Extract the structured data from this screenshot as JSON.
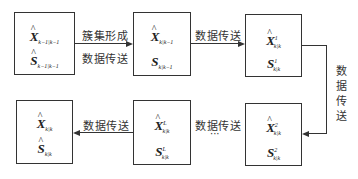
{
  "diagram": {
    "nodes": [
      {
        "id": "box1",
        "x_base": "X",
        "x_hat": true,
        "x_sup": "",
        "x_sub": "k−1|k−1",
        "s_base": "S",
        "s_hat": true,
        "s_sup": "",
        "s_sub": "k−1|k−1"
      },
      {
        "id": "box2",
        "x_base": "X",
        "x_hat": true,
        "x_sup": "",
        "x_sub": "k|k−1",
        "s_base": "S",
        "s_hat": false,
        "s_sup": "",
        "s_sub": "k|k−1"
      },
      {
        "id": "box3",
        "x_base": "X",
        "x_hat": true,
        "x_sup": "1",
        "x_sub": "k|k",
        "s_base": "S",
        "s_hat": false,
        "s_sup": "1",
        "s_sub": "k|k"
      },
      {
        "id": "box4",
        "x_base": "X",
        "x_hat": true,
        "x_sup": "2",
        "x_sub": "k|k",
        "s_base": "S",
        "s_hat": false,
        "s_sup": "2",
        "s_sub": "k|k"
      },
      {
        "id": "box5",
        "x_base": "X",
        "x_hat": true,
        "x_sup": "L",
        "x_sub": "k|k",
        "s_base": "S",
        "s_hat": false,
        "s_sup": "L",
        "s_sub": "k|k"
      },
      {
        "id": "box6",
        "x_base": "X",
        "x_hat": true,
        "x_sup": "",
        "x_sub": "k|k",
        "s_base": "S",
        "s_hat": true,
        "s_sup": "",
        "s_sub": "k|k"
      }
    ],
    "hat_glyph": "^",
    "edges": [
      {
        "from": "box1",
        "to": "box2",
        "label_top": "簇集形成",
        "label_bottom": "数据传送"
      },
      {
        "from": "box2",
        "to": "box3",
        "label_top": "数据传送"
      },
      {
        "from": "box3",
        "to": "box4",
        "label_vertical": "数据传送"
      },
      {
        "from": "box4",
        "to": "box5",
        "label_top": "数据传送",
        "label_bottom": "···"
      },
      {
        "from": "box5",
        "to": "box6",
        "label_top": "数据传送"
      }
    ]
  }
}
